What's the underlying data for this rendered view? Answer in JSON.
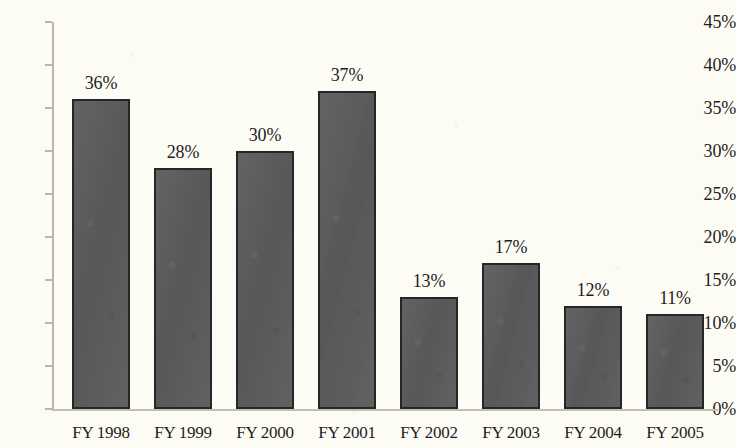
{
  "chart_data": {
    "type": "bar",
    "title": "",
    "subtitle": "",
    "xlabel": "",
    "ylabel": "",
    "categories": [
      "FY 1998",
      "FY 1999",
      "FY 2000",
      "FY 2001",
      "FY 2002",
      "FY 2003",
      "FY 2004",
      "FY 2005"
    ],
    "values": [
      36,
      28,
      30,
      37,
      13,
      17,
      12,
      11
    ],
    "data_labels": [
      "36%",
      "28%",
      "30%",
      "37%",
      "13%",
      "17%",
      "12%",
      "11%"
    ],
    "ylim": [
      0,
      45
    ],
    "ytick_values": [
      0,
      5,
      10,
      15,
      20,
      25,
      30,
      35,
      40,
      45
    ],
    "ytick_labels": [
      "0%",
      "5%",
      "10%",
      "15%",
      "20%",
      "25%",
      "30%",
      "35%",
      "40%",
      "45%"
    ],
    "grid": false,
    "legend": null,
    "legend_position": "none",
    "series": [
      {
        "name": "",
        "values": [
          36,
          28,
          30,
          37,
          13,
          17,
          12,
          11
        ]
      }
    ],
    "colors": {
      "bar_fill": "#5c5c5c",
      "bar_border": "#262626",
      "background": "#fdfcf4",
      "axis": "#b9b6ab",
      "text": "#1d1d1d"
    }
  }
}
